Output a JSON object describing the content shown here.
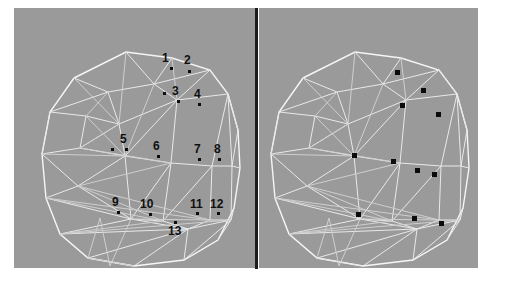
{
  "figure": {
    "kind": "side-by-side-3d-mesh-comparison",
    "background_color": "#ffffff",
    "panel_color": "#9a9a9a",
    "wireframe_color": "#e9e9e9",
    "marker_color": "#0d0d0d",
    "divider_color": "#1c1c1c"
  },
  "panels": [
    {
      "id": "left",
      "name": "annotated-mesh-panel",
      "description": "3D triangulated wireframe head mesh with numbered landmark points",
      "x": 14,
      "y": 8,
      "width": 243,
      "height": 260
    },
    {
      "id": "right",
      "name": "unannotated-mesh-panel",
      "description": "3D triangulated wireframe head mesh with unlabelled landmark markers",
      "x": 259,
      "y": 8,
      "width": 219,
      "height": 260
    }
  ],
  "landmarks": [
    {
      "id": 1,
      "label": "1",
      "label_x": 162,
      "label_y": 52,
      "dot_x": 170,
      "dot_y": 67
    },
    {
      "id": 2,
      "label": "2",
      "label_x": 184,
      "label_y": 54,
      "dot_x": 188,
      "dot_y": 70
    },
    {
      "id": 3,
      "label": "3",
      "label_x": 172,
      "label_y": 85,
      "dot_x": 177,
      "dot_y": 100
    },
    {
      "id": 4,
      "label": "4",
      "label_x": 194,
      "label_y": 88,
      "dot_x": 198,
      "dot_y": 103
    },
    {
      "id": 5,
      "label": "5",
      "label_x": 120,
      "label_y": 133,
      "dot_x": 125,
      "dot_y": 148
    },
    {
      "id": 6,
      "label": "6",
      "label_x": 153,
      "label_y": 140,
      "dot_x": 157,
      "dot_y": 155
    },
    {
      "id": 7,
      "label": "7",
      "label_x": 194,
      "label_y": 143,
      "dot_x": 198,
      "dot_y": 158
    },
    {
      "id": 8,
      "label": "8",
      "label_x": 214,
      "label_y": 143,
      "dot_x": 218,
      "dot_y": 158
    },
    {
      "id": 9,
      "label": "9",
      "label_x": 112,
      "label_y": 196,
      "dot_x": 117,
      "dot_y": 211
    },
    {
      "id": 10,
      "label": "10",
      "label_x": 140,
      "label_y": 198,
      "dot_x": 149,
      "dot_y": 213
    },
    {
      "id": 11,
      "label": "11",
      "label_x": 190,
      "label_y": 198,
      "dot_x": 196,
      "dot_y": 212
    },
    {
      "id": 12,
      "label": "12",
      "label_x": 210,
      "label_y": 198,
      "dot_x": 217,
      "dot_y": 212
    },
    {
      "id": 13,
      "label": "13",
      "label_x": 168,
      "label_y": 225,
      "dot_x": 174,
      "dot_y": 221
    }
  ],
  "right_markers": [
    {
      "x": 395,
      "y": 70
    },
    {
      "x": 421,
      "y": 88
    },
    {
      "x": 400,
      "y": 103
    },
    {
      "x": 436,
      "y": 112
    },
    {
      "x": 352,
      "y": 153
    },
    {
      "x": 391,
      "y": 159
    },
    {
      "x": 415,
      "y": 168
    },
    {
      "x": 432,
      "y": 172
    },
    {
      "x": 356,
      "y": 212
    },
    {
      "x": 412,
      "y": 216
    },
    {
      "x": 439,
      "y": 221
    }
  ]
}
